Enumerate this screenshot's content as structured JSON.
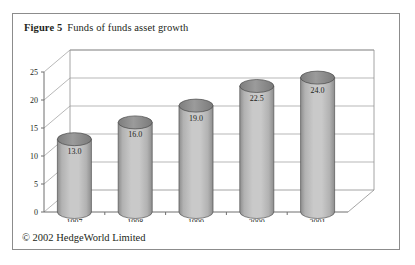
{
  "figure": {
    "number_label": "Figure 5",
    "title": "Funds of funds asset growth",
    "copyright": "© 2002 HedgeWorld Limited"
  },
  "chart_data": {
    "type": "bar",
    "title": "Funds of funds asset growth",
    "xlabel": "Assets (US$ billion)",
    "ylabel": "",
    "categories": [
      "1997",
      "1998",
      "1999",
      "2000",
      "2001"
    ],
    "values": [
      13.0,
      16.0,
      19.0,
      22.5,
      24.0
    ],
    "value_labels": [
      "13.0",
      "16.0",
      "19.0",
      "22.5",
      "24.0"
    ],
    "ylim": [
      0,
      25
    ],
    "ytick_labels": [
      "0",
      "5",
      "10",
      "15",
      "20",
      "25"
    ],
    "ytick_values": [
      0,
      5,
      10,
      15,
      20,
      25
    ],
    "grid": true,
    "legend": false,
    "style": "3d-cylinder",
    "colors": {
      "bar_light": "#c9c9c9",
      "bar_mid": "#b2b2b2",
      "bar_dark": "#8d8d8d",
      "bar_top": "#8f8f8f",
      "grid": "#9a9a9a",
      "axis": "#6f6f6f",
      "frame": "#8c8c8c",
      "text": "#231f20"
    }
  }
}
